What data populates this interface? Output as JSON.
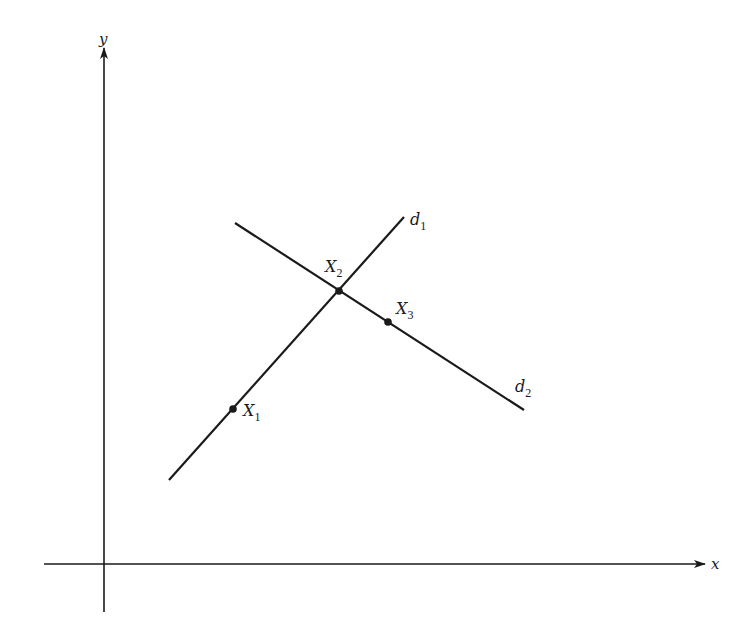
{
  "diagram": {
    "axes": {
      "x": {
        "label": "x",
        "color": "#1a1a1a"
      },
      "y": {
        "label": "y",
        "color": "#1a1a1a"
      }
    },
    "lines": [
      {
        "id": "d1",
        "label": "d",
        "subscript": "1"
      },
      {
        "id": "d2",
        "label": "d",
        "subscript": "2"
      }
    ],
    "points": [
      {
        "id": "X1",
        "label": "X",
        "subscript": "1",
        "note": "on d1"
      },
      {
        "id": "X2",
        "label": "X",
        "subscript": "2",
        "note": "intersection of d1 and d2"
      },
      {
        "id": "X3",
        "label": "X",
        "subscript": "3",
        "note": "on d2"
      }
    ]
  }
}
